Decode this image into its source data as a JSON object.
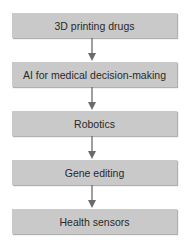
{
  "diagram": {
    "type": "vertical-flowchart",
    "steps": [
      {
        "label": "3D printing drugs"
      },
      {
        "label": "AI for medical decision-making"
      },
      {
        "label": "Robotics"
      },
      {
        "label": "Gene editing"
      },
      {
        "label": "Health sensors"
      }
    ],
    "connectors": [
      {
        "from": 0,
        "to": 1
      },
      {
        "from": 1,
        "to": 2
      },
      {
        "from": 2,
        "to": 3
      },
      {
        "from": 3,
        "to": 4
      }
    ],
    "colors": {
      "box": "#c9c9c9",
      "arrow": "#6b6b6b",
      "text": "#2a2a2a"
    }
  }
}
